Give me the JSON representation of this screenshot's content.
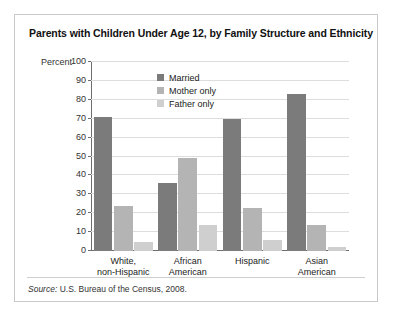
{
  "figure": {
    "title": "Parents with Children Under Age 12, by Family Structure and Ethnicity",
    "source_prefix": "Source:",
    "source_text": "U.S. Bureau of the Census, 2008."
  },
  "legend": {
    "position": "inside-top-center",
    "items": [
      {
        "label": "Married",
        "color": "#7b7b7b"
      },
      {
        "label": "Mother only",
        "color": "#b4b4b4"
      },
      {
        "label": "Father only",
        "color": "#cfcfcf"
      }
    ]
  },
  "chart_data": {
    "type": "bar",
    "title": "Parents with Children Under Age 12, by Family Structure and Ethnicity",
    "xlabel": "",
    "ylabel": "Percent",
    "ylim": [
      0,
      100
    ],
    "yticks": [
      0,
      10,
      20,
      30,
      40,
      50,
      60,
      70,
      80,
      90,
      100
    ],
    "grid": true,
    "legend": [
      "Married",
      "Mother only",
      "Father only"
    ],
    "categories": [
      "White,\nnon-Hispanic",
      "African\nAmerican",
      "Hispanic",
      "Asian\nAmerican"
    ],
    "categories_lines": [
      [
        "White,",
        "non-Hispanic"
      ],
      [
        "African",
        "American"
      ],
      [
        "Hispanic",
        ""
      ],
      [
        "Asian",
        "American"
      ]
    ],
    "series": [
      {
        "name": "Married",
        "color": "#7b7b7b",
        "values": [
          71,
          36,
          70,
          83
        ]
      },
      {
        "name": "Mother only",
        "color": "#b4b4b4",
        "values": [
          24,
          49,
          23,
          14
        ]
      },
      {
        "name": "Father only",
        "color": "#cfcfcf",
        "values": [
          5,
          14,
          6,
          2
        ]
      }
    ]
  }
}
